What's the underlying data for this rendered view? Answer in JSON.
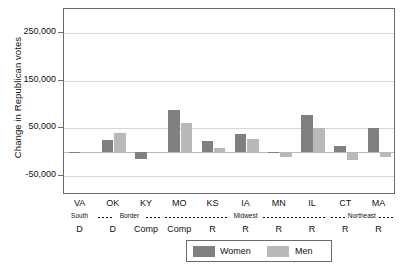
{
  "chart_data": {
    "type": "bar",
    "title": "",
    "xlabel": "",
    "ylabel": "Change in Republican votes",
    "ylim": [
      -90000,
      300000
    ],
    "grid": true,
    "legend_position": "bottom-center",
    "yticks": [
      "250,000",
      "150,000",
      "50,000",
      "-50,000"
    ],
    "ytick_values": [
      250000,
      150000,
      50000,
      -50000
    ],
    "categories": [
      "VA",
      "OK",
      "KY",
      "MO",
      "KS",
      "IA",
      "MN",
      "IL",
      "CT",
      "MA"
    ],
    "region_row": [
      "South",
      "Border",
      "Midwest",
      "Northeast"
    ],
    "party_row": [
      "D",
      "D",
      "Comp",
      "Comp",
      "R",
      "R",
      "R",
      "R",
      "R",
      "R"
    ],
    "series": [
      {
        "name": "Women",
        "color": "#808080",
        "values": [
          -3000,
          26000,
          -14000,
          88000,
          24000,
          38000,
          -3000,
          78000,
          13000,
          50000
        ]
      },
      {
        "name": "Men",
        "color": "#b9b9b9",
        "values": [
          -1000,
          40000,
          -2000,
          62000,
          9000,
          28000,
          -10000,
          50000,
          -17000,
          -11000
        ]
      }
    ]
  },
  "legend": {
    "women_label": "Women",
    "men_label": "Men"
  },
  "axis": {
    "y_title": "Change in Republican votes"
  },
  "regions": [
    {
      "label": "South",
      "start": 0,
      "end": 0
    },
    {
      "label": "Border",
      "start": 1,
      "end": 2
    },
    {
      "label": "Midwest",
      "start": 3,
      "end": 7
    },
    {
      "label": "Northeast",
      "start": 8,
      "end": 9
    }
  ]
}
